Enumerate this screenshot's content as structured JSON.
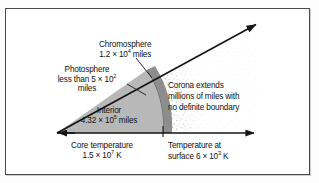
{
  "figure": {
    "frame_color": "#4a4a4a",
    "background_color": "#ffffff"
  },
  "labels": {
    "chromosphere": {
      "name": "Chromosphere",
      "value_line": "1.2 × 10",
      "exponent": "4",
      "unit": " miles"
    },
    "photosphere": {
      "name": "Photosphere",
      "value_line": "less than 5 × 10",
      "exponent": "2",
      "unit": "miles"
    },
    "interior": {
      "name": "Interior",
      "value_line": "4.32 × 10",
      "exponent": "5",
      "unit": " miles"
    },
    "corona": {
      "line1": "Corona extends",
      "line2": "millions of miles with",
      "line3": "no definite boundary"
    },
    "core_temperature": {
      "line1": "Core temperature",
      "value_line": "1.5 × 10",
      "exponent": "7",
      "unit": " K"
    },
    "surface_temperature": {
      "line1": "Temperature at",
      "value_line": "surface 6 × 10",
      "exponent": "3",
      "unit": " K"
    }
  },
  "geometry": {
    "apex_x": 57,
    "apex_y": 133,
    "horizontal_arrow_tip_x": 262,
    "diagonal_arrow_tip_x": 258,
    "diagonal_arrow_tip_y": 23,
    "interior_arc_radius": 106,
    "chromosphere_arc_radius": 115,
    "corona_outer_radius": 200
  },
  "colors": {
    "interior_fill": "#b9b9b9",
    "chromosphere_fill": "#8f8f8f",
    "photosphere_line": "#6e6e6e",
    "corona_stipple": "#9a9a9a",
    "line_color": "#1a1a1a",
    "text_color": "#101010"
  }
}
